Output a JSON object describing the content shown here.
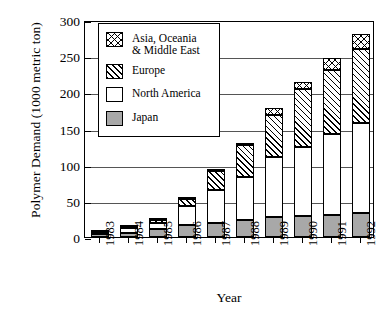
{
  "chart_data": {
    "type": "bar",
    "subtype": "stacked-vertical",
    "title": "",
    "xlabel": "Year",
    "ylabel": "Polymer Demand (1000 metric ton)",
    "categories": [
      "1983",
      "1984",
      "1985",
      "1986",
      "1987",
      "1988",
      "1989",
      "1990",
      "1991",
      "1992"
    ],
    "series": [
      {
        "name": "Japan",
        "values": [
          4,
          6,
          11,
          16,
          20,
          24,
          27,
          29,
          30,
          33
        ]
      },
      {
        "name": "North America",
        "values": [
          3,
          6,
          9,
          27,
          45,
          59,
          83,
          96,
          113,
          125
        ]
      },
      {
        "name": "Europe",
        "values": [
          1,
          2,
          3,
          10,
          26,
          44,
          58,
          80,
          88,
          102
        ]
      },
      {
        "name": "Asia, Oceania & Middle East",
        "values": [
          0,
          1,
          3,
          2,
          2,
          3,
          10,
          10,
          17,
          20
        ]
      }
    ],
    "totals": [
      8,
      15,
      26,
      55,
      93,
      130,
      178,
      215,
      248,
      280
    ],
    "ylim": [
      0,
      300
    ],
    "yticks": [
      0,
      50,
      100,
      150,
      200,
      250,
      300
    ],
    "ytick_labels": [
      "0",
      "50",
      "100",
      "150",
      "200",
      "250",
      "300"
    ],
    "grid": true,
    "legend_position": "upper-left-inside"
  },
  "legend": {
    "items": [
      {
        "label": "Asia, Oceania\n& Middle East",
        "pattern": "cross-hatch",
        "swatch_name": "legend-swatch-asia"
      },
      {
        "label": "Europe",
        "pattern": "diagonal-hatch",
        "swatch_name": "legend-swatch-europe"
      },
      {
        "label": "North America",
        "pattern": "solid-white",
        "swatch_name": "legend-swatch-north-america"
      },
      {
        "label": "Japan",
        "pattern": "solid-gray",
        "swatch_name": "legend-swatch-japan"
      }
    ]
  },
  "colors": {
    "japan": "#a8a8a8",
    "north_america": "#ffffff",
    "europe": "#ffffff",
    "asia": "#ffffff",
    "axis": "#000000",
    "grid": "#555555",
    "background": "#ffffff"
  }
}
